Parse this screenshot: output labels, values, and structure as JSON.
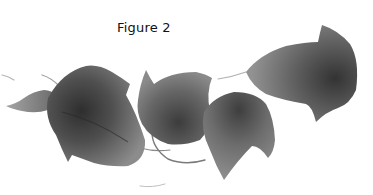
{
  "figure": {
    "caption": "Figure 2",
    "colors": {
      "background": "#ffffff",
      "leaf_dark": "#3a3a3a",
      "leaf_mid": "#6e6e6e",
      "leaf_light": "#9a9a9a",
      "stem": "#8a8a8a",
      "caption_text": "#111111"
    },
    "leaves": [
      {
        "id": "small-left-leaf",
        "label": "small leaf"
      },
      {
        "id": "large-left-leaf",
        "label": "large leaf"
      },
      {
        "id": "center-leaf",
        "label": "center leaf"
      },
      {
        "id": "lower-right-leaf",
        "label": "lower right leaf"
      },
      {
        "id": "upper-right-leaf",
        "label": "upper right leaf"
      }
    ]
  }
}
